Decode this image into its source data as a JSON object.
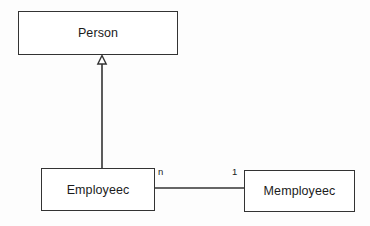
{
  "diagram": {
    "type": "uml-class-diagram",
    "background_color": "#fdfdfd",
    "line_color": "#333333",
    "text_color": "#1b1b1b",
    "classes": [
      {
        "id": "person",
        "name": "Person"
      },
      {
        "id": "employeec",
        "name": "Employeec"
      },
      {
        "id": "memployeec",
        "name": "Memployeec"
      }
    ],
    "relationships": [
      {
        "id": "generalization",
        "kind": "generalization",
        "from": "Employeec",
        "to": "Person",
        "arrowhead": "hollow-triangle"
      },
      {
        "id": "association",
        "kind": "association",
        "from": "Employeec",
        "to": "Memployeec",
        "source_multiplicity": "n",
        "target_multiplicity": "1"
      }
    ]
  }
}
